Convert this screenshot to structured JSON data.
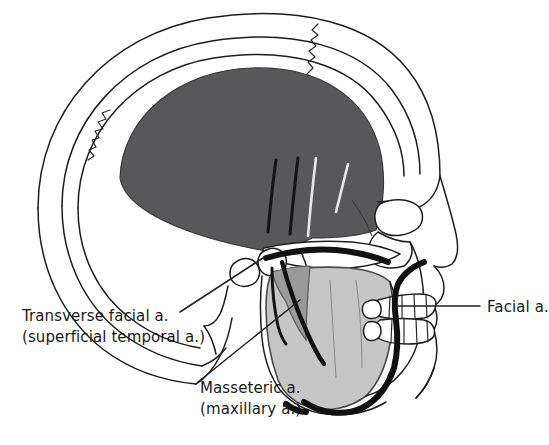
{
  "figure": {
    "background_color": "#ffffff"
  },
  "colors": {
    "temporalis_muscle": "#58585a",
    "masseter_muscle": "#c6c6c6",
    "masseter_deep": "#9a9a9a",
    "bone_outline": "#1d1d1d",
    "bone_fill": "#ffffff",
    "artery": "#111111",
    "text": "#1a1a1a"
  },
  "labels": {
    "transverse_facial": {
      "line1": "Transverse facial a.",
      "line2": "(superficial temporal a.)"
    },
    "masseteric": {
      "line1": "Masseteric a.",
      "line2": "(maxillary a.)"
    },
    "facial": {
      "line1": "Facial a."
    }
  },
  "structures": [
    {
      "name": "cranial-vault",
      "type": "bone"
    },
    {
      "name": "coronal-suture",
      "type": "suture"
    },
    {
      "name": "temporalis-muscle",
      "type": "muscle",
      "shade": "dark"
    },
    {
      "name": "zygomatic-arch",
      "type": "bone"
    },
    {
      "name": "mandibular-condyle",
      "type": "bone"
    },
    {
      "name": "masseter-muscle",
      "type": "muscle",
      "shade": "light"
    },
    {
      "name": "mandible-ramus",
      "type": "bone"
    },
    {
      "name": "maxilla",
      "type": "bone"
    },
    {
      "name": "upper-teeth",
      "type": "teeth"
    },
    {
      "name": "lower-teeth",
      "type": "teeth"
    },
    {
      "name": "orbit",
      "type": "bone"
    },
    {
      "name": "nasal-aperture",
      "type": "bone"
    },
    {
      "name": "external-acoustic-meatus",
      "type": "bone"
    },
    {
      "name": "mastoid-process",
      "type": "bone"
    }
  ],
  "arteries": [
    {
      "name": "transverse-facial-artery",
      "label_ref": "transverse_facial"
    },
    {
      "name": "deep-temporal-artery-anterior",
      "label_ref": "masseteric"
    },
    {
      "name": "deep-temporal-artery-middle",
      "label_ref": "masseteric"
    },
    {
      "name": "deep-temporal-artery-posterior",
      "label_ref": "masseteric"
    },
    {
      "name": "masseteric-artery",
      "label_ref": "masseteric"
    },
    {
      "name": "facial-artery",
      "label_ref": "facial"
    }
  ]
}
